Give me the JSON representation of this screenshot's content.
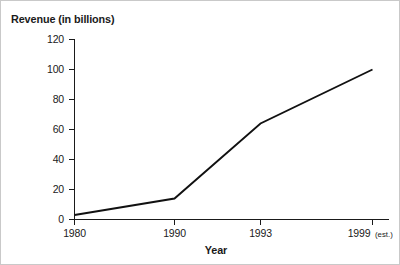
{
  "chart_data": {
    "type": "line",
    "title": "",
    "xlabel": "Year",
    "ylabel": "Revenue (in billions)",
    "categories": [
      "1980",
      "1990",
      "1993",
      "1999 (est.)"
    ],
    "values": [
      3,
      14,
      64,
      100
    ],
    "series": [
      {
        "name": "Revenue",
        "values": [
          3,
          14,
          64,
          100
        ]
      }
    ],
    "ylim": [
      0,
      120
    ],
    "yticks": [
      0,
      20,
      40,
      60,
      80,
      100,
      120
    ],
    "ytick_labels": [
      "0",
      "20",
      "40",
      "60",
      "80",
      "100",
      "120"
    ],
    "xtick_labels": [
      "1980",
      "1990",
      "1993",
      "1999 (est.)"
    ],
    "grid": false,
    "legend": "none",
    "line_color": "#111111",
    "axis_color": "#1a1a1a",
    "background_color": "#ffffff"
  },
  "axes": {
    "y_title": "Revenue (in billions)",
    "x_title": "Year"
  },
  "xticks": [
    {
      "label": "1980",
      "suffix": ""
    },
    {
      "label": "1990",
      "suffix": ""
    },
    {
      "label": "1993",
      "suffix": ""
    },
    {
      "label": "1999",
      "suffix": "(est.)"
    }
  ],
  "yticks": [
    {
      "label": "120"
    },
    {
      "label": "100"
    },
    {
      "label": "80"
    },
    {
      "label": "60"
    },
    {
      "label": "40"
    },
    {
      "label": "20"
    },
    {
      "label": "0"
    }
  ]
}
